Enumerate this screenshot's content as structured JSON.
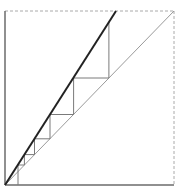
{
  "diagram": {
    "type": "cobweb-plot",
    "width": 180,
    "height": 195,
    "frame": {
      "x0": 5,
      "y0": 185,
      "x1": 174,
      "y1": 11,
      "axis_color": "#6b6b6b",
      "frame_dash_color": "#aaaaaa"
    },
    "identity_line": {
      "from": [
        5,
        185
      ],
      "to": [
        174,
        11
      ],
      "color": "#9a9a9a"
    },
    "map_line": {
      "from": [
        5,
        185
      ],
      "to": [
        116,
        11
      ],
      "color": "#222222"
    },
    "cobweb": {
      "color": "#7a7a7a",
      "points": [
        [
          18,
          185
        ],
        [
          18,
          165
        ],
        [
          24.4,
          165
        ],
        [
          24.4,
          154.6
        ],
        [
          34.5,
          154.6
        ],
        [
          34.5,
          138.8
        ],
        [
          50,
          138.8
        ],
        [
          50,
          114.5
        ],
        [
          73.6,
          114.5
        ],
        [
          73.6,
          78
        ],
        [
          108.9,
          78
        ],
        [
          108.9,
          22
        ]
      ]
    },
    "text": []
  }
}
